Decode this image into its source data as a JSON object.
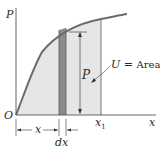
{
  "figure": {
    "type": "work-area-diagram"
  },
  "axes": {
    "vertical_label": "P",
    "horizontal_label": "x",
    "origin_label": "O"
  },
  "labels": {
    "strip_height": "P",
    "area_eq_U": "U",
    "area_eq_sign": "=",
    "area_eq_text": "Area",
    "x_dim": "x",
    "dx_dim": "dx",
    "x1_main": "x",
    "x1_sub": "1"
  },
  "colors": {
    "curve": "#6b6b6b",
    "axis": "#555555",
    "area_fill": "#e6e6e6",
    "strip_fill": "#8c8c8c",
    "line": "#555555",
    "text": "#2a2a2a"
  }
}
